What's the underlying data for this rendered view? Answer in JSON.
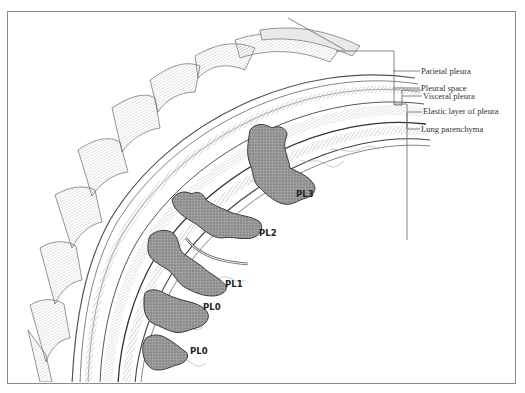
{
  "figure": {
    "colors": {
      "frame": "#8a8a8a",
      "tumor_fill": "#8c8c8c",
      "tumor_outline": "#3a3a3a",
      "line": "#555555",
      "background": "#ffffff"
    }
  },
  "structure_labels": [
    {
      "id": "parietal-pleura",
      "text": "Parietal pleura"
    },
    {
      "id": "pleural-space",
      "text": "Pleural space"
    },
    {
      "id": "visceral-pleura",
      "text": "Visceral pleura"
    },
    {
      "id": "elastic-layer",
      "text": "Elastic layer of pleura"
    },
    {
      "id": "lung-parenchyma",
      "text": "Lung parenchyma"
    }
  ],
  "tumor_labels": [
    {
      "id": "pl3",
      "text": "PL3"
    },
    {
      "id": "pl2",
      "text": "PL2"
    },
    {
      "id": "pl1",
      "text": "PL1"
    },
    {
      "id": "pl0-upper",
      "text": "PL0"
    },
    {
      "id": "pl0-lower",
      "text": "PL0"
    }
  ]
}
